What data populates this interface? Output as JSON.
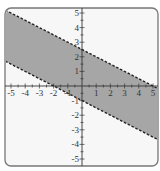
{
  "chart_data": {
    "type": "area",
    "title": "",
    "xlabel": "",
    "ylabel": "",
    "xlim": [
      -5.4,
      5.4
    ],
    "ylim": [
      -5.4,
      5.4
    ],
    "grid": false,
    "x_ticks": [
      -5,
      -4,
      -3,
      -2,
      -1,
      1,
      2,
      3,
      4,
      5
    ],
    "y_ticks": [
      -5,
      -4,
      -3,
      -2,
      -1,
      1,
      2,
      3,
      4,
      5
    ],
    "x_tick_labels": [
      "-5",
      "-4",
      "-3",
      "-2",
      "-1",
      "1",
      "2",
      "3",
      "4",
      "5"
    ],
    "y_tick_labels": [
      "-5",
      "-4",
      "-3",
      "-2",
      "-1",
      "1",
      "2",
      "3",
      "4",
      "5"
    ],
    "series": [
      {
        "name": "upper boundary",
        "equation": "y = -0.5x + 2.5",
        "style": "dashed",
        "x": [
          -5.4,
          5.4
        ],
        "y": [
          5.2,
          -0.2
        ]
      },
      {
        "name": "lower boundary",
        "equation": "y = -0.5x - 1",
        "style": "dashed",
        "x": [
          -5.4,
          5.4
        ],
        "y": [
          1.7,
          -3.7
        ]
      }
    ],
    "shaded_region": "-0.5x - 1 < y < -0.5x + 2.5",
    "colors": {
      "fill": "#a6a6a6",
      "line": "#222222",
      "axis": "#333333",
      "frame": "#777777",
      "background": "#f7f7f7"
    }
  }
}
